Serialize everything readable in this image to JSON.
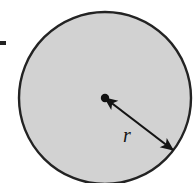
{
  "figure": {
    "name": "circle-radius-diagram",
    "caption_text": "",
    "width": 195,
    "height": 183,
    "background_color": "#ffffff"
  },
  "circle": {
    "name": "shaded-circle",
    "center_x": 105,
    "center_y": 98,
    "radius": 86,
    "fill_color": "#d2d2d2",
    "stroke_color": "#232323",
    "stroke_width": 2.4
  },
  "center_point": {
    "name": "center-dot",
    "x": 105,
    "y": 98,
    "radius": 4.2,
    "color": "#111111"
  },
  "radius_arrow": {
    "name": "radius-double-arrow",
    "from_x": 105,
    "from_y": 98,
    "to_x": 173,
    "to_y": 150,
    "stroke_color": "#141414",
    "stroke_width": 2.2,
    "arrowheads": "both"
  },
  "labels": {
    "radius_symbol": "r",
    "radius_symbol_x": 127,
    "radius_symbol_y": 142,
    "radius_symbol_size": 20
  },
  "edge_marks": {
    "left_tick_name": "left-edge-tick-mark",
    "left_tick_x": 0,
    "left_tick_y": 41,
    "left_tick_width": 6,
    "left_tick_height": 4,
    "left_tick_color": "#222222"
  },
  "colors": {
    "shape_fill": "#d2d2d2",
    "outline": "#232323",
    "annotation": "#141414",
    "page_background": "#ffffff"
  }
}
